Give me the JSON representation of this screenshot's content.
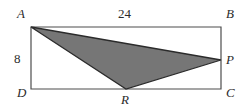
{
  "figure": {
    "background_color": "#ffffff",
    "outline_color": "#4d4d4d",
    "shade_color": "#767676",
    "shade_outline_color": "#2b2b2b",
    "text_color": "#2b2b2b",
    "vertices": {
      "A": {
        "label": "A",
        "x": 31,
        "y": 27
      },
      "B": {
        "label": "B",
        "x": 221,
        "y": 27
      },
      "C": {
        "label": "C",
        "x": 221,
        "y": 89
      },
      "D": {
        "label": "D",
        "x": 31,
        "y": 89
      },
      "P": {
        "label": "P",
        "x": 221,
        "y": 60
      },
      "R": {
        "label": "R",
        "x": 126,
        "y": 89
      }
    },
    "measurements": {
      "top_length": "24",
      "left_length": "8"
    },
    "shaded_region": {
      "name": "triangle-APR",
      "points": "31,27 221,60 126,89"
    },
    "rectangle": {
      "points": "31,27 221,27 221,89 31,89"
    }
  }
}
